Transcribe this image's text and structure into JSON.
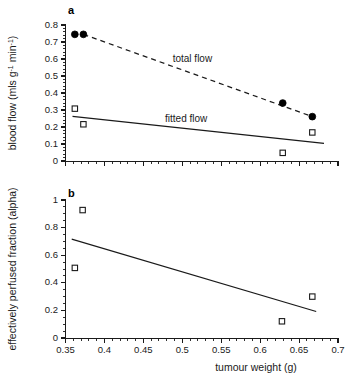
{
  "figure": {
    "panel_a_label": "a",
    "panel_b_label": "b",
    "xlabel": "tumour weight (g)"
  },
  "chart_data": [
    {
      "type": "scatter",
      "panel": "a",
      "title": "",
      "xlabel": "",
      "ylabel": "blood flow (mls g-1 min-1)",
      "ylabel_parts": {
        "lead": "blood flow (mls g",
        "sup1": "-1",
        "mid": " min",
        "sup2": "-1",
        "tail": ")"
      },
      "xlim": [
        0.35,
        0.7
      ],
      "ylim": [
        0,
        0.8
      ],
      "xticks": [
        0.35,
        0.4,
        0.45,
        0.5,
        0.55,
        0.6,
        0.65,
        0.7
      ],
      "xticklabels": [
        "",
        "",
        "",
        "",
        "",
        "",
        "",
        ""
      ],
      "yticks": [
        0,
        0.1,
        0.2,
        0.3,
        0.4,
        0.5,
        0.6,
        0.7,
        0.8
      ],
      "yticklabels": [
        "0",
        "0.1",
        "0.2",
        "0.3",
        "0.4",
        "0.5",
        "0.6",
        "0.7",
        "0.8"
      ],
      "x_minor_interval": 0.01,
      "y_minor_interval": 0.02,
      "grid": false,
      "legend": "inline-annotations",
      "series": [
        {
          "name": "total flow",
          "marker": "filled-circle",
          "annotation": "total flow",
          "annotation_x": 0.513,
          "annotation_y": 0.585,
          "points": [
            {
              "x": 0.362,
              "y": 0.745
            },
            {
              "x": 0.373,
              "y": 0.745
            },
            {
              "x": 0.629,
              "y": 0.341
            },
            {
              "x": 0.667,
              "y": 0.261
            }
          ]
        },
        {
          "name": "fitted flow",
          "marker": "open-square",
          "annotation": "fitted flow",
          "annotation_x": 0.505,
          "annotation_y": 0.232,
          "points": [
            {
              "x": 0.362,
              "y": 0.308
            },
            {
              "x": 0.373,
              "y": 0.216
            },
            {
              "x": 0.629,
              "y": 0.048
            },
            {
              "x": 0.667,
              "y": 0.168
            }
          ]
        }
      ],
      "fit_lines": [
        {
          "name": "total-flow-fit",
          "style": "dashed",
          "x0": 0.373,
          "y0": 0.745,
          "x1": 0.667,
          "y1": 0.261
        },
        {
          "name": "fitted-flow-fit",
          "style": "solid",
          "x0": 0.359,
          "y0": 0.262,
          "x1": 0.682,
          "y1": 0.104
        }
      ]
    },
    {
      "type": "scatter",
      "panel": "b",
      "title": "",
      "xlabel": "tumour weight (g)",
      "ylabel": "effectively perfused fraction (alpha)",
      "xlim": [
        0.35,
        0.7
      ],
      "ylim": [
        0,
        1
      ],
      "xticks": [
        0.35,
        0.4,
        0.45,
        0.5,
        0.55,
        0.6,
        0.65,
        0.7
      ],
      "xticklabels": [
        "0.35",
        "0.4",
        "0.45",
        "0.5",
        "0.55",
        "0.6",
        "0.65",
        "0.7"
      ],
      "yticks": [
        0,
        0.2,
        0.4,
        0.6,
        0.8,
        1
      ],
      "yticklabels": [
        "0",
        "0.2",
        "0.4",
        "0.6",
        "0.8",
        "1"
      ],
      "x_minor_interval": 0.01,
      "y_minor_interval": 0.05,
      "grid": false,
      "legend": "none",
      "series": [
        {
          "name": "effectively perfused fraction",
          "marker": "open-square",
          "points": [
            {
              "x": 0.372,
              "y": 0.927
            },
            {
              "x": 0.362,
              "y": 0.508
            },
            {
              "x": 0.628,
              "y": 0.121
            },
            {
              "x": 0.667,
              "y": 0.3
            }
          ]
        }
      ],
      "fit_lines": [
        {
          "name": "alpha-fit",
          "style": "solid",
          "x0": 0.358,
          "y0": 0.716,
          "x1": 0.672,
          "y1": 0.192
        }
      ]
    }
  ]
}
